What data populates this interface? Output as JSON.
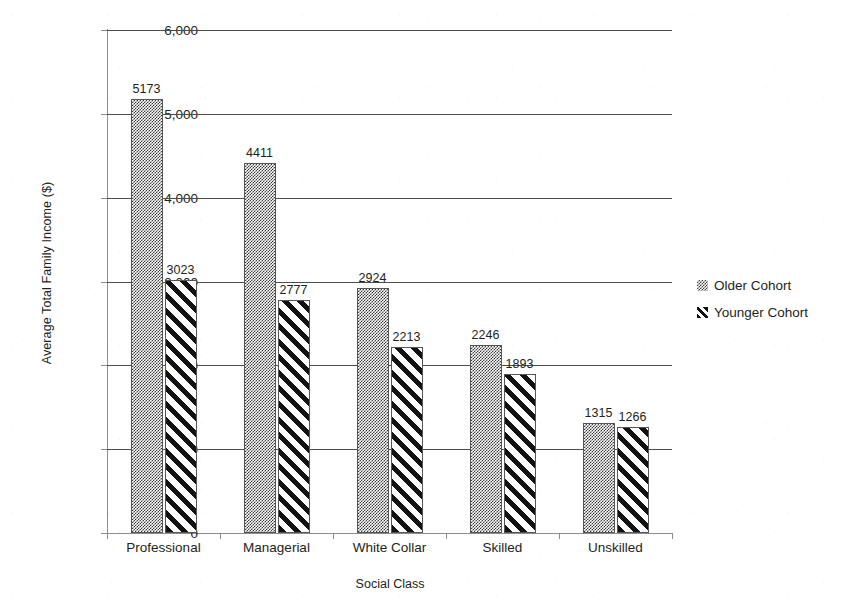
{
  "chart_data": {
    "type": "bar",
    "title": "",
    "xlabel": "Social Class",
    "ylabel": "Average Total Family Income ($)",
    "categories": [
      "Professional",
      "Managerial",
      "White Collar",
      "Skilled",
      "Unskilled"
    ],
    "series": [
      {
        "name": "Older Cohort",
        "values": [
          5173,
          4411,
          2924,
          2246,
          1315
        ],
        "pattern": "checkerboard",
        "color": "#3a3a3a"
      },
      {
        "name": "Younger Cohort",
        "values": [
          3023,
          2777,
          2213,
          1893,
          1266
        ],
        "pattern": "diagonal-stripes",
        "color": "#121212"
      }
    ],
    "ylim": [
      0,
      6000
    ],
    "ytick_values": [
      0,
      1000,
      2000,
      3000,
      4000,
      5000,
      6000
    ],
    "ytick_labels": [
      "0",
      "1,000",
      "2,000",
      "3,000",
      "4,000",
      "5,000",
      "6,000"
    ],
    "grid": true,
    "grid_axis": "y",
    "data_labels": true,
    "legend_position": "right"
  },
  "legend": {
    "entries": [
      {
        "label": "Older Cohort",
        "swatch": "checkerboard-swatch-icon"
      },
      {
        "label": "Younger Cohort",
        "swatch": "diagonal-stripe-swatch-icon"
      }
    ]
  }
}
